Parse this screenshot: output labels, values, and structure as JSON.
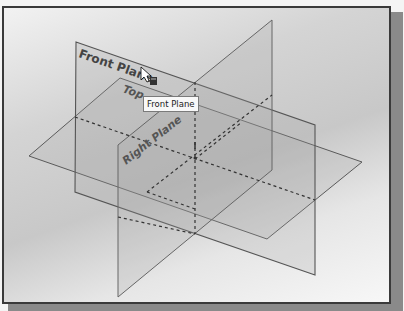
{
  "viewport": {
    "planes": {
      "front": {
        "label": "Front Plane"
      },
      "top": {
        "label": "Top Plane",
        "visible_label": "Top"
      },
      "right": {
        "label": "Right Plane",
        "visible_label": "Right Plane"
      }
    },
    "cursor_label": "Front Plane",
    "tooltip": {
      "text": "Front Plane"
    },
    "colors": {
      "edge": "#5a5a5a",
      "plane_fill": "#b8b8b8",
      "frame": "#3a3a3a"
    }
  }
}
